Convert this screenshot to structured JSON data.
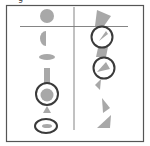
{
  "figure": {
    "label": "g",
    "colors": {
      "shape_fill": "#a8a8a8",
      "ring_stroke": "#3a3a3a",
      "frame_stroke": "#555555",
      "divider_stroke": "#777777"
    },
    "left_column": [
      {
        "shape": "circle",
        "ringed": false
      },
      {
        "shape": "half-circle",
        "ringed": false
      },
      {
        "shape": "flat-ellipse",
        "ringed": false
      },
      {
        "shape": "vertical-bar",
        "ringed": false
      },
      {
        "shape": "circle",
        "ringed": true
      },
      {
        "shape": "triangle",
        "ringed": false
      },
      {
        "shape": "small-ellipse",
        "ringed": true
      }
    ],
    "right_column": [
      {
        "shape": "tilted-square",
        "ringed": false
      },
      {
        "shape": "wedge",
        "ringed": true
      },
      {
        "shape": "skewed-quad",
        "ringed": false
      },
      {
        "shape": "wedge",
        "ringed": true
      },
      {
        "shape": "small-wedge",
        "ringed": false
      },
      {
        "shape": "triangle",
        "ringed": false
      },
      {
        "shape": "triangle",
        "ringed": false
      }
    ]
  }
}
